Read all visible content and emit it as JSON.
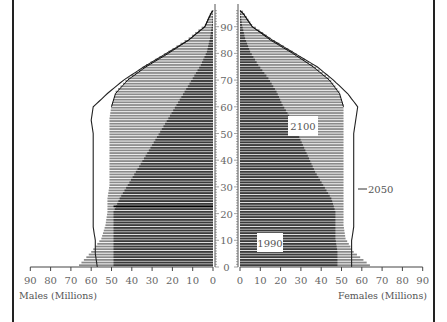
{
  "chart_data": {
    "type": "population-pyramid",
    "title": "",
    "left_axis": {
      "label": "Males (Millions)",
      "ticks": [
        90,
        80,
        70,
        60,
        50,
        40,
        30,
        20,
        10,
        0
      ],
      "range": [
        0,
        90
      ]
    },
    "right_axis": {
      "label": "Females (Millions)",
      "ticks": [
        0,
        10,
        20,
        30,
        40,
        50,
        60,
        70,
        80,
        90
      ],
      "range": [
        0,
        90
      ]
    },
    "age_axis": {
      "ticks": [
        0,
        10,
        20,
        30,
        40,
        50,
        60,
        70,
        80,
        90
      ],
      "range": [
        0,
        95
      ]
    },
    "grid": false,
    "annotations": [
      "1990",
      "2050",
      "2100"
    ],
    "series": [
      {
        "name": "1990",
        "style": "dark fill",
        "ages": [
          0,
          5,
          10,
          15,
          20,
          25,
          30,
          35,
          40,
          45,
          50,
          55,
          60,
          65,
          70,
          75,
          80,
          85,
          90,
          95
        ],
        "males": [
          49,
          49,
          49,
          49,
          49,
          46,
          42,
          38,
          34,
          30,
          26,
          22,
          18,
          14,
          10,
          6,
          3,
          1.5,
          0.5,
          0.1
        ],
        "females": [
          48,
          48,
          47,
          47,
          47,
          45,
          41,
          37,
          34,
          31,
          28,
          25,
          21,
          18,
          14,
          9,
          5,
          2.5,
          1,
          0.2
        ]
      },
      {
        "name": "2100",
        "style": "light horizontal hatching",
        "ages": [
          0,
          5,
          10,
          15,
          20,
          25,
          30,
          35,
          40,
          45,
          50,
          55,
          60,
          65,
          70,
          75,
          80,
          85,
          90,
          95
        ],
        "males": [
          66,
          60,
          55,
          53,
          52,
          52,
          51,
          51,
          51,
          51,
          51,
          51,
          50,
          48,
          42,
          33,
          22,
          12,
          4,
          1
        ],
        "females": [
          64,
          56,
          52,
          51,
          51,
          51,
          51,
          51,
          51,
          51,
          51,
          51,
          51,
          49,
          44,
          36,
          26,
          15,
          6,
          1.5
        ]
      },
      {
        "name": "2050",
        "style": "outline",
        "ages": [
          0,
          5,
          10,
          15,
          20,
          25,
          30,
          35,
          40,
          45,
          50,
          55,
          60,
          65,
          70,
          75,
          80,
          85,
          90,
          95
        ],
        "males": [
          57,
          58,
          58,
          59,
          59,
          59,
          59,
          59,
          59,
          59,
          59,
          60,
          59,
          52,
          44,
          34,
          23,
          12,
          4,
          1
        ],
        "females": [
          55,
          55,
          55,
          56,
          56,
          56,
          56,
          56,
          56,
          56,
          56,
          57,
          58,
          53,
          46,
          38,
          27,
          16,
          6,
          1.5
        ]
      }
    ]
  },
  "labels": {
    "males_axis": "Males (Millions)",
    "females_axis": "Females (Millions)",
    "year_1990": "1990",
    "year_2050": "2050",
    "year_2100": "2100"
  }
}
